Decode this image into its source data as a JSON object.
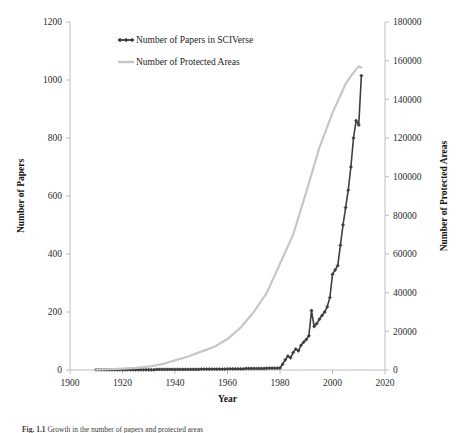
{
  "figure": {
    "caption_label": "Fig. 1.1",
    "caption_text": "Growth in the number of papers and protected areas"
  },
  "chart_data": {
    "type": "line",
    "title": "",
    "xlabel": "Year",
    "ylabel": "Number of Papers",
    "y2label": "Number of Protected Areas",
    "grid": false,
    "legend_position": "top-left-inside",
    "xlim": [
      1900,
      2020
    ],
    "xticks": [
      1900,
      1920,
      1940,
      1960,
      1980,
      2000,
      2020
    ],
    "ylim": [
      0,
      1200
    ],
    "yticks": [
      0,
      200,
      400,
      600,
      800,
      1000,
      1200
    ],
    "y2lim": [
      0,
      180000
    ],
    "y2ticks": [
      0,
      20000,
      40000,
      60000,
      80000,
      100000,
      120000,
      140000,
      160000,
      180000
    ],
    "colors": {
      "papers": "#3f3f3f",
      "protected_areas": "#c6c6c6",
      "axis": "#bfbfbf",
      "text": "#1a1a1a"
    },
    "series": [
      {
        "name": "Number of Papers in SCIVerse",
        "axis": "left",
        "color": "#3f3f3f",
        "marker": "diamond",
        "x": [
          1910,
          1911,
          1912,
          1913,
          1914,
          1915,
          1916,
          1917,
          1918,
          1919,
          1920,
          1921,
          1922,
          1923,
          1924,
          1925,
          1926,
          1927,
          1928,
          1929,
          1930,
          1931,
          1932,
          1933,
          1934,
          1935,
          1936,
          1937,
          1938,
          1939,
          1940,
          1941,
          1942,
          1943,
          1944,
          1945,
          1946,
          1947,
          1948,
          1949,
          1950,
          1951,
          1952,
          1953,
          1954,
          1955,
          1956,
          1957,
          1958,
          1959,
          1960,
          1961,
          1962,
          1963,
          1964,
          1965,
          1966,
          1967,
          1968,
          1969,
          1970,
          1971,
          1972,
          1973,
          1974,
          1975,
          1976,
          1977,
          1978,
          1979,
          1980,
          1981,
          1982,
          1983,
          1984,
          1985,
          1986,
          1987,
          1988,
          1989,
          1990,
          1991,
          1992,
          1993,
          1994,
          1995,
          1996,
          1997,
          1998,
          1999,
          2000,
          2001,
          2002,
          2003,
          2004,
          2005,
          2006,
          2007,
          2008,
          2009,
          2010,
          2011
        ],
        "y": [
          1,
          1,
          1,
          1,
          1,
          1,
          1,
          1,
          1,
          1,
          1,
          1,
          1,
          1,
          1,
          1,
          1,
          1,
          1,
          1,
          1,
          1,
          1,
          2,
          2,
          2,
          2,
          2,
          2,
          2,
          2,
          2,
          2,
          2,
          2,
          2,
          2,
          2,
          2,
          2,
          3,
          3,
          3,
          3,
          3,
          3,
          3,
          3,
          3,
          3,
          4,
          4,
          4,
          4,
          4,
          4,
          4,
          5,
          5,
          5,
          5,
          5,
          5,
          5,
          5,
          6,
          6,
          6,
          6,
          6,
          7,
          20,
          35,
          48,
          42,
          60,
          72,
          66,
          85,
          96,
          105,
          118,
          205,
          150,
          160,
          175,
          188,
          200,
          218,
          250,
          330,
          345,
          360,
          430,
          500,
          560,
          620,
          700,
          800,
          860,
          845,
          1015
        ]
      },
      {
        "name": "Number of Protected Areas",
        "axis": "right",
        "color": "#c6c6c6",
        "marker": "none",
        "x": [
          1910,
          1915,
          1920,
          1925,
          1930,
          1935,
          1940,
          1945,
          1950,
          1955,
          1960,
          1965,
          1970,
          1975,
          1980,
          1985,
          1990,
          1995,
          2000,
          2003,
          2005,
          2007,
          2009,
          2010,
          2011
        ],
        "y": [
          200,
          400,
          700,
          1100,
          1700,
          3000,
          5000,
          7000,
          9500,
          12000,
          16000,
          22000,
          30000,
          40000,
          55000,
          70000,
          92000,
          115000,
          133000,
          142000,
          148000,
          152000,
          155500,
          157000,
          156500
        ]
      }
    ]
  }
}
